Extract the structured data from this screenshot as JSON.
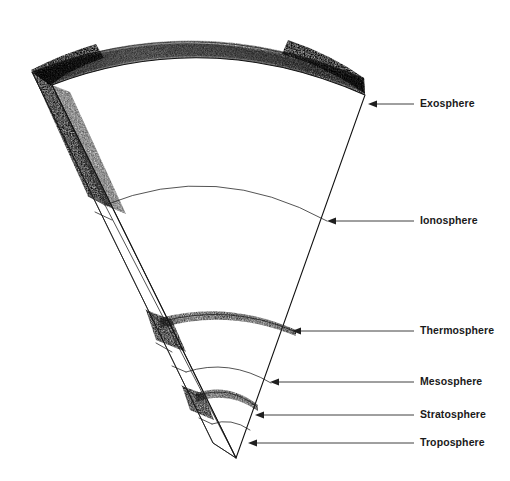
{
  "figure": {
    "style": "hand-drawn pencil / charcoal shaded sector",
    "background_color": "#ffffff",
    "ink_color": "#111111",
    "label_color": "#1a1a1a",
    "leader_color": "#2b2b2b"
  },
  "labels": [
    {
      "id": "exosphere",
      "text": "Exosphere",
      "label_x": 420,
      "label_y": 104,
      "leader_x1": 414,
      "leader_x2": 375,
      "arrow_tip_x": 368,
      "arrow_y": 104
    },
    {
      "id": "ionosphere",
      "text": "Ionosphere",
      "label_x": 420,
      "label_y": 221,
      "leader_x1": 414,
      "leader_x2": 334,
      "arrow_tip_x": 327,
      "arrow_y": 221
    },
    {
      "id": "thermosphere",
      "text": "Thermosphere",
      "label_x": 420,
      "label_y": 331,
      "leader_x1": 414,
      "leader_x2": 299,
      "arrow_tip_x": 292,
      "arrow_y": 331
    },
    {
      "id": "mesosphere",
      "text": "Mesosphere",
      "label_x": 420,
      "label_y": 382,
      "leader_x1": 414,
      "leader_x2": 277,
      "arrow_tip_x": 270,
      "arrow_y": 382
    },
    {
      "id": "stratosphere",
      "text": "Stratosphere",
      "label_x": 420,
      "label_y": 415,
      "leader_x1": 414,
      "leader_x2": 262,
      "arrow_tip_x": 255,
      "arrow_y": 415
    },
    {
      "id": "troposphere",
      "text": "Troposphere",
      "label_x": 420,
      "label_y": 443,
      "leader_x1": 414,
      "leader_x2": 255,
      "arrow_tip_x": 248,
      "arrow_y": 443
    }
  ],
  "geometry": {
    "apex_x": 236,
    "apex_y": 458,
    "top_arc_left_x": 52,
    "top_arc_left_y": 85,
    "top_arc_right_x": 365,
    "top_arc_right_y": 95,
    "side_face_top_x": 32,
    "side_face_top_y": 72,
    "boundary_arcs": [
      {
        "id": "exosphere-top",
        "label": "Exosphere outer boundary",
        "shaded": true
      },
      {
        "id": "ionosphere-boundary",
        "label": "Ionosphere boundary",
        "shaded": false
      },
      {
        "id": "thermosphere-boundary",
        "label": "Thermosphere boundary",
        "shaded": true
      },
      {
        "id": "mesosphere-boundary",
        "label": "Mesosphere boundary",
        "shaded": false
      },
      {
        "id": "stratosphere-boundary",
        "label": "Stratosphere boundary",
        "shaded": true
      },
      {
        "id": "troposphere-boundary",
        "label": "Troposphere boundary",
        "shaded": false
      }
    ]
  }
}
